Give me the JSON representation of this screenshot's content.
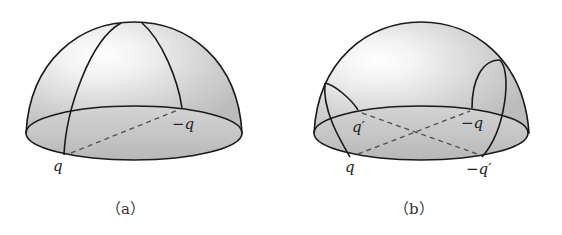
{
  "figures": [
    {
      "id": "a",
      "caption": "（a）",
      "labels": {
        "q": "q",
        "neg_q": "−q"
      }
    },
    {
      "id": "b",
      "caption": "（b）",
      "labels": {
        "q": "q",
        "q_prime": "q′",
        "neg_q": "−q",
        "neg_q_prime": "−q′"
      }
    }
  ],
  "colors": {
    "stroke": "#1a1a1a",
    "dome_fill": "#cfcfcf",
    "base_fill": "#bdbdbd",
    "highlight": "#ffffff",
    "dashed": "#555555"
  }
}
